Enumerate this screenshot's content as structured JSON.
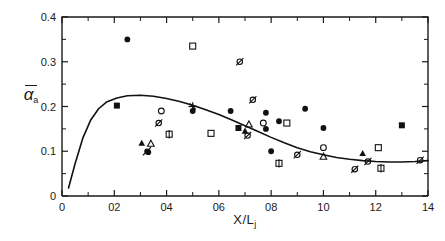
{
  "chart_data": {
    "type": "scatter",
    "title": "",
    "subtitle": "",
    "xlabel": "X/L",
    "xlabel_sub": "j",
    "ylabel": "α",
    "ylabel_sub": "a",
    "ylabel_overbar": true,
    "xlim": [
      0,
      1.4
    ],
    "ylim": [
      0,
      0.4
    ],
    "xticks": [
      0,
      0.2,
      0.4,
      0.6,
      0.8,
      1.0,
      1.2,
      1.4
    ],
    "xticklabels": [
      "0",
      "02",
      "04",
      "06",
      "08",
      "10",
      "12",
      "14"
    ],
    "xminorticks": [
      0.1,
      0.3,
      0.5,
      0.7,
      0.9,
      1.1,
      1.3
    ],
    "yticks": [
      0,
      0.1,
      0.2,
      0.3,
      0.4
    ],
    "yticklabels": [
      "0",
      "0.1",
      "0.2",
      "0.3",
      "0.4"
    ],
    "yminorticks": [
      0.05,
      0.15,
      0.25,
      0.35
    ],
    "grid": false,
    "legend": "none",
    "series": [
      {
        "name": "filled-circle",
        "marker": "filled-circle",
        "points": [
          [
            0.25,
            0.35
          ],
          [
            0.5,
            0.19
          ],
          [
            0.645,
            0.19
          ],
          [
            0.78,
            0.186
          ],
          [
            0.83,
            0.167
          ],
          [
            0.93,
            0.195
          ],
          [
            1.0,
            0.152
          ],
          [
            0.8,
            0.1
          ],
          [
            0.78,
            0.15
          ],
          [
            0.33,
            0.098
          ]
        ]
      },
      {
        "name": "open-circle",
        "marker": "open-circle",
        "points": [
          [
            0.38,
            0.19
          ],
          [
            0.77,
            0.163
          ],
          [
            1.0,
            0.108
          ]
        ]
      },
      {
        "name": "filled-square",
        "marker": "filled-square",
        "points": [
          [
            0.21,
            0.202
          ],
          [
            0.675,
            0.152
          ],
          [
            1.3,
            0.158
          ]
        ]
      },
      {
        "name": "open-square",
        "marker": "open-square",
        "points": [
          [
            0.5,
            0.335
          ],
          [
            0.57,
            0.14
          ],
          [
            0.86,
            0.163
          ],
          [
            1.21,
            0.108
          ]
        ]
      },
      {
        "name": "filled-triangle",
        "marker": "filled-triangle",
        "points": [
          [
            0.305,
            0.118
          ],
          [
            0.7,
            0.145
          ],
          [
            1.15,
            0.095
          ]
        ]
      },
      {
        "name": "open-triangle",
        "marker": "open-triangle",
        "points": [
          [
            0.34,
            0.117
          ],
          [
            0.715,
            0.16
          ],
          [
            1.0,
            0.088
          ]
        ]
      },
      {
        "name": "slashed-circle",
        "marker": "slashed-circle",
        "points": [
          [
            0.68,
            0.3
          ],
          [
            0.73,
            0.215
          ],
          [
            0.37,
            0.163
          ],
          [
            0.9,
            0.092
          ],
          [
            1.37,
            0.08
          ],
          [
            1.12,
            0.06
          ],
          [
            0.71,
            0.135
          ],
          [
            1.17,
            0.077
          ]
        ]
      },
      {
        "name": "crossed-square",
        "marker": "crossed-square",
        "points": [
          [
            0.41,
            0.138
          ],
          [
            0.83,
            0.073
          ],
          [
            1.22,
            0.062
          ]
        ]
      },
      {
        "name": "star-cross",
        "marker": "star-cross",
        "points": [
          [
            0.5,
            0.2
          ]
        ]
      },
      {
        "name": "filled-circle-slash",
        "marker": "filled-circle-slash",
        "points": [
          [
            0.325,
            0.1
          ]
        ]
      }
    ],
    "curve": {
      "name": "fitted-curve",
      "points": [
        [
          0.025,
          0.018
        ],
        [
          0.05,
          0.072
        ],
        [
          0.08,
          0.13
        ],
        [
          0.11,
          0.17
        ],
        [
          0.14,
          0.195
        ],
        [
          0.17,
          0.21
        ],
        [
          0.21,
          0.219
        ],
        [
          0.25,
          0.224
        ],
        [
          0.3,
          0.225
        ],
        [
          0.35,
          0.223
        ],
        [
          0.4,
          0.218
        ],
        [
          0.45,
          0.211
        ],
        [
          0.5,
          0.203
        ],
        [
          0.55,
          0.193
        ],
        [
          0.6,
          0.182
        ],
        [
          0.65,
          0.17
        ],
        [
          0.7,
          0.157
        ],
        [
          0.75,
          0.144
        ],
        [
          0.8,
          0.131
        ],
        [
          0.85,
          0.119
        ],
        [
          0.9,
          0.108
        ],
        [
          0.95,
          0.099
        ],
        [
          1.0,
          0.092
        ],
        [
          1.05,
          0.086
        ],
        [
          1.1,
          0.082
        ],
        [
          1.15,
          0.079
        ],
        [
          1.2,
          0.077
        ],
        [
          1.25,
          0.076
        ],
        [
          1.3,
          0.076
        ],
        [
          1.35,
          0.077
        ],
        [
          1.4,
          0.079
        ]
      ]
    }
  }
}
